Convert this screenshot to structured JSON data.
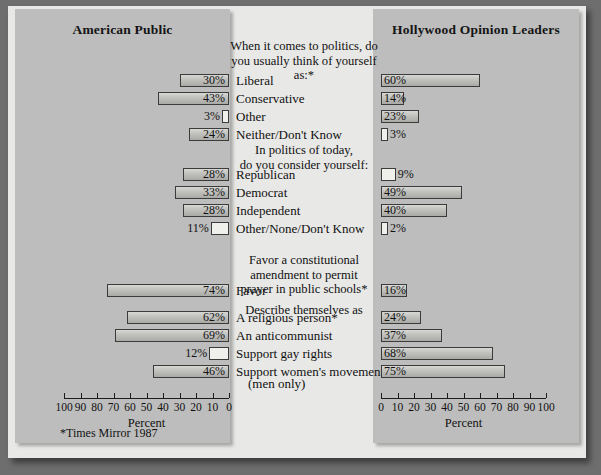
{
  "panels": {
    "left_title": "American Public",
    "right_title": "Hollywood Opinion Leaders"
  },
  "axis": {
    "left_title": "Percent",
    "right_title": "Percent",
    "left_ticks": [
      "100",
      "90",
      "80",
      "70",
      "60",
      "50",
      "40",
      "30",
      "20",
      "10",
      "0"
    ],
    "right_ticks": [
      "0",
      "10",
      "20",
      "30",
      "40",
      "50",
      "60",
      "70",
      "80",
      "90",
      "100"
    ]
  },
  "footnote": "*Times Mirror 1987",
  "chart_data": {
    "type": "bar",
    "xlabel": "Percent",
    "ylabel": "",
    "xlim": [
      0,
      100
    ],
    "grid": false,
    "legend": [
      "American Public",
      "Hollywood Opinion Leaders"
    ],
    "legend_position": "panel-headers",
    "orientation": "horizontal-bidirectional",
    "groups": [
      {
        "heading": "When it comes to politics, do you usually think of yourself as:*",
        "categories": [
          "Liberal",
          "Conservative",
          "Other",
          "Neither/Don't Know"
        ],
        "series": [
          {
            "name": "American Public",
            "values": [
              30,
              43,
              3,
              24
            ]
          },
          {
            "name": "Hollywood Opinion Leaders",
            "values": [
              60,
              14,
              23,
              3
            ]
          }
        ]
      },
      {
        "heading": "In politics of today, do you consider yourself:",
        "categories": [
          "Republican",
          "Democrat",
          "Independent",
          "Other/None/Don't Know"
        ],
        "series": [
          {
            "name": "American Public",
            "values": [
              28,
              33,
              28,
              11
            ]
          },
          {
            "name": "Hollywood Opinion Leaders",
            "values": [
              9,
              49,
              40,
              2
            ]
          }
        ]
      },
      {
        "heading": "Favor a constitutional amendment to permit prayer in public schools*",
        "categories": [
          "Favor"
        ],
        "series": [
          {
            "name": "American Public",
            "values": [
              74
            ]
          },
          {
            "name": "Hollywood Opinion Leaders",
            "values": [
              16
            ]
          }
        ]
      },
      {
        "heading": "Describe themselves as",
        "categories": [
          "A religious person*",
          "An anticommunist",
          "Support gay rights",
          "Support women's movement (men only)"
        ],
        "series": [
          {
            "name": "American Public",
            "values": [
              62,
              69,
              12,
              46
            ]
          },
          {
            "name": "Hollywood Opinion Leaders",
            "values": [
              24,
              37,
              68,
              75
            ]
          }
        ]
      }
    ]
  },
  "rows": [
    {
      "label": "Liberal",
      "left": 30,
      "right": 60,
      "left_text": "30%",
      "right_text": "60%"
    },
    {
      "label": "Conservative",
      "left": 43,
      "right": 14,
      "left_text": "43%",
      "right_text": "14%"
    },
    {
      "label": "Other",
      "left": 3,
      "right": 23,
      "left_text": "3%",
      "right_text": "23%"
    },
    {
      "label": "Neither/Don't Know",
      "left": 24,
      "right": 3,
      "left_text": "24%",
      "right_text": "3%"
    },
    {
      "label": "Republican",
      "left": 28,
      "right": 9,
      "left_text": "28%",
      "right_text": "9%"
    },
    {
      "label": "Democrat",
      "left": 33,
      "right": 49,
      "left_text": "33%",
      "right_text": "49%"
    },
    {
      "label": "Independent",
      "left": 28,
      "right": 40,
      "left_text": "28%",
      "right_text": "40%"
    },
    {
      "label": "Other/None/Don't Know",
      "left": 11,
      "right": 2,
      "left_text": "11%",
      "right_text": "2%"
    },
    {
      "label": "Favor",
      "left": 74,
      "right": 16,
      "left_text": "74%",
      "right_text": "16%"
    },
    {
      "label": "A religious person*",
      "left": 62,
      "right": 24,
      "left_text": "62%",
      "right_text": "24%"
    },
    {
      "label": "An anticommunist",
      "left": 69,
      "right": 37,
      "left_text": "69%",
      "right_text": "37%"
    },
    {
      "label": "Support gay rights",
      "left": 12,
      "right": 68,
      "left_text": "12%",
      "right_text": "68%"
    },
    {
      "label": "Support women's movement",
      "left": 46,
      "right": 75,
      "left_text": "46%",
      "right_text": "75%"
    },
    {
      "label": "(men only)",
      "left": null,
      "right": null,
      "left_text": "",
      "right_text": ""
    }
  ],
  "headings": [
    {
      "lines": [
        "When it comes to politics, do",
        "you usually think of yourself as:*"
      ]
    },
    {
      "lines": [
        "In politics of today,",
        "do you consider yourself:"
      ]
    },
    {
      "lines": [
        "Favor a constitutional",
        "amendment to permit",
        "prayer in public schools*"
      ]
    },
    {
      "lines": [
        "Describe themselves as"
      ]
    }
  ]
}
